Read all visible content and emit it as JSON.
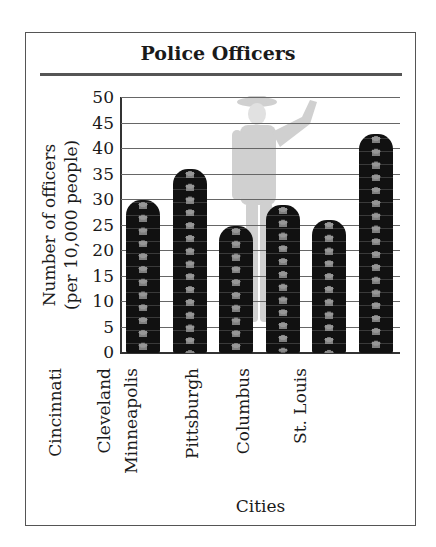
{
  "chart_data": {
    "type": "bar",
    "title": "Police Officers",
    "xlabel": "Cities",
    "ylabel": "Number of officers (per 10,000 people)",
    "ylabel_lines": [
      "Number of officers",
      "(per 10,000 people)"
    ],
    "categories": [
      "Cincinnati",
      "Cleveland",
      "Minneapolis",
      "Pittsburgh",
      "Columbus",
      "St. Louis"
    ],
    "values": [
      30,
      36,
      25,
      29,
      26,
      43
    ],
    "ylim": [
      0,
      50
    ],
    "yticks": [
      0,
      5,
      10,
      15,
      20,
      25,
      30,
      35,
      40,
      45,
      50
    ],
    "grid": true,
    "legend": null,
    "bar_style": "pictograph of stacked police hats",
    "background_image": "faded police officer figure"
  }
}
